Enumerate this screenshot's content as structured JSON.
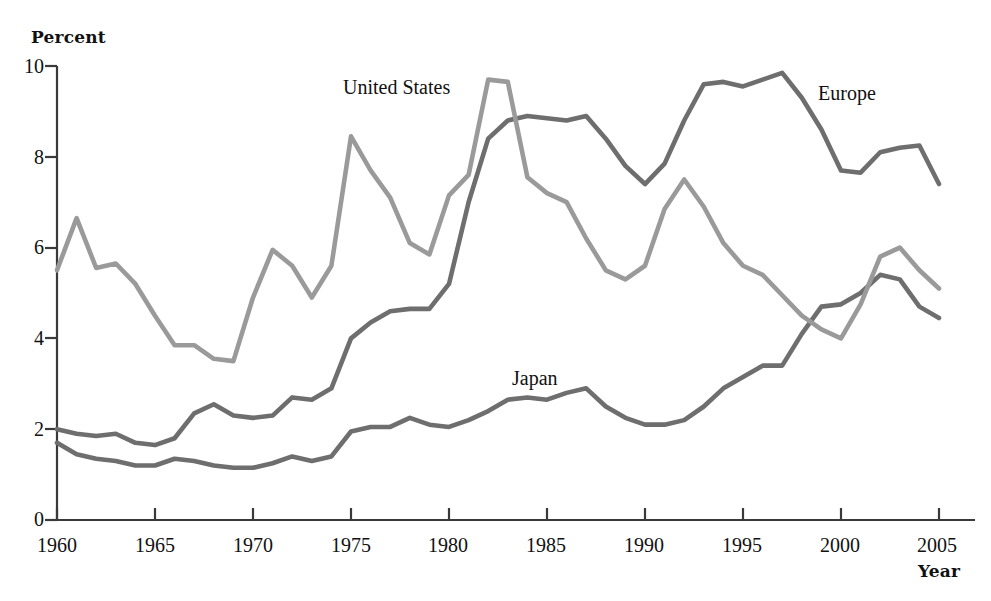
{
  "chart_data": {
    "type": "line",
    "title": "",
    "xlabel": "Year",
    "ylabel": "Percent",
    "xlim": [
      1960,
      2005
    ],
    "ylim": [
      0,
      10
    ],
    "grid": false,
    "legend_position": "inline-labels",
    "x": [
      1960,
      1961,
      1962,
      1963,
      1964,
      1965,
      1966,
      1967,
      1968,
      1969,
      1970,
      1971,
      1972,
      1973,
      1974,
      1975,
      1976,
      1977,
      1978,
      1979,
      1980,
      1981,
      1982,
      1983,
      1984,
      1985,
      1986,
      1987,
      1988,
      1989,
      1990,
      1991,
      1992,
      1993,
      1994,
      1995,
      1996,
      1997,
      1998,
      1999,
      2000,
      2001,
      2002,
      2003,
      2004,
      2005
    ],
    "xticks": [
      1960,
      1965,
      1970,
      1975,
      1980,
      1985,
      1990,
      1995,
      2000,
      2005
    ],
    "yticks": [
      0,
      2,
      4,
      6,
      8,
      10
    ],
    "series": [
      {
        "name": "United States",
        "color": "#9a9a9a",
        "values": [
          5.5,
          6.65,
          5.55,
          5.65,
          5.2,
          4.5,
          3.85,
          3.85,
          3.55,
          3.5,
          4.9,
          5.95,
          5.6,
          4.9,
          5.6,
          8.45,
          7.7,
          7.1,
          6.1,
          5.85,
          7.15,
          7.6,
          9.7,
          9.65,
          7.55,
          7.2,
          7.0,
          6.2,
          5.5,
          5.3,
          5.6,
          6.85,
          7.5,
          6.9,
          6.1,
          5.6,
          5.4,
          4.95,
          4.5,
          4.2,
          4.0,
          4.75,
          5.8,
          6.0,
          5.5,
          5.1
        ]
      },
      {
        "name": "Europe",
        "color": "#6e6e6e",
        "values": [
          2.0,
          1.9,
          1.85,
          1.9,
          1.7,
          1.65,
          1.8,
          2.35,
          2.55,
          2.3,
          2.25,
          2.3,
          2.7,
          2.65,
          2.9,
          4.0,
          4.35,
          4.6,
          4.65,
          4.65,
          5.2,
          7.0,
          8.4,
          8.8,
          8.9,
          8.85,
          8.8,
          8.9,
          8.4,
          7.8,
          7.4,
          7.85,
          8.8,
          9.6,
          9.65,
          9.55,
          9.7,
          9.85,
          9.3,
          8.6,
          7.7,
          7.65,
          8.1,
          8.2,
          8.25,
          7.4
        ]
      },
      {
        "name": "Japan",
        "color": "#6e6e6e",
        "values": [
          1.7,
          1.45,
          1.35,
          1.3,
          1.2,
          1.2,
          1.35,
          1.3,
          1.2,
          1.15,
          1.15,
          1.25,
          1.4,
          1.3,
          1.4,
          1.95,
          2.05,
          2.05,
          2.25,
          2.1,
          2.05,
          2.2,
          2.4,
          2.65,
          2.7,
          2.65,
          2.8,
          2.9,
          2.5,
          2.25,
          2.1,
          2.1,
          2.2,
          2.5,
          2.9,
          3.15,
          3.4,
          3.4,
          4.1,
          4.7,
          4.75,
          5.0,
          5.4,
          5.3,
          4.7,
          4.45
        ]
      }
    ]
  },
  "axes": {
    "y_title": "Percent",
    "x_title": "Year",
    "ytick_labels": [
      "10",
      "8",
      "6",
      "4",
      "2",
      "0"
    ],
    "xtick_labels": [
      "1960",
      "1965",
      "1970",
      "1975",
      "1980",
      "1985",
      "1990",
      "1995",
      "2000",
      "2005"
    ]
  },
  "annotations": [
    {
      "name": "united-states",
      "text": "United States"
    },
    {
      "name": "europe",
      "text": "Europe"
    },
    {
      "name": "japan",
      "text": "Japan"
    }
  ],
  "colors": {
    "united_states": "#9a9a9a",
    "europe": "#6e6e6e",
    "japan": "#6e6e6e",
    "axis": "#3a3a3a",
    "text": "#111111",
    "background": "#ffffff"
  }
}
